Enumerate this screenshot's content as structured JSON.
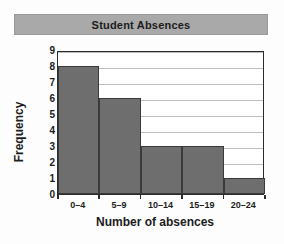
{
  "chart_data": {
    "type": "bar",
    "title": "Student Absences",
    "xlabel": "Number of absences",
    "ylabel": "Frequency",
    "categories": [
      "0–4",
      "5–9",
      "10–14",
      "15–19",
      "20–24"
    ],
    "values": [
      8,
      6,
      3,
      3,
      1
    ],
    "ylim": [
      0,
      9
    ],
    "ytick_labels": [
      "0",
      "1",
      "2",
      "3",
      "4",
      "5",
      "6",
      "7",
      "8",
      "9"
    ],
    "grid": "horizontal",
    "legend": "none",
    "colors": {
      "bar_fill": "#6e6e6e",
      "bar_border": "#3a3a3a",
      "title_band": "#a9a9a9",
      "plot_background": "#ffffff",
      "axis": "#2b2b2b",
      "gridline": "#bdbdbd",
      "text": "#1c1c1c"
    }
  }
}
